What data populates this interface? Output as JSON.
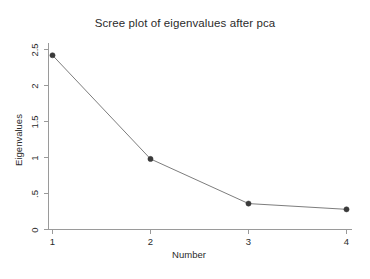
{
  "chart_data": {
    "type": "line",
    "title": "Scree plot of eigenvalues after pca",
    "xlabel": "Number",
    "ylabel": "Eigenvalues",
    "x": [
      1,
      2,
      3,
      4
    ],
    "values": [
      2.42,
      0.98,
      0.36,
      0.28
    ],
    "categories": [
      "1",
      "2",
      "3",
      "4"
    ],
    "series": [
      {
        "name": "Eigenvalues",
        "values": [
          2.42,
          0.98,
          0.36,
          0.28
        ]
      }
    ],
    "xlim": [
      0.8,
      4.2
    ],
    "ylim": [
      0,
      2.6
    ],
    "xticks": [
      1,
      2,
      3,
      4
    ],
    "xtick_labels": [
      "1",
      "2",
      "3",
      "4"
    ],
    "yticks": [
      0,
      0.5,
      1,
      1.5,
      2,
      2.5
    ],
    "ytick_labels": [
      "0",
      ".5",
      "1",
      "1.5",
      "2",
      "2.5"
    ],
    "grid": false,
    "legend": false,
    "legend_position": "none",
    "marker": "circle",
    "line_color": "#7d7d7d",
    "marker_color": "#3a3a3a",
    "background_color": "#ffffff",
    "axis_color": "#9a9a9a",
    "text_color": "#2b2b2b"
  },
  "axes": {
    "y_tick_labels": [
      "2.5",
      "2",
      "1.5",
      "1",
      ".5",
      "0"
    ],
    "x_tick_labels": [
      "1",
      "2",
      "3",
      "4"
    ],
    "x_axis_title": "Number",
    "y_axis_title": "Eigenvalues"
  }
}
